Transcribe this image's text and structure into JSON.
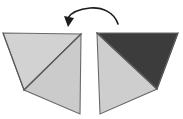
{
  "figure": {
    "canvas": {
      "width": 183,
      "height": 119,
      "background": "#ffffff"
    },
    "colors": {
      "light_gray": "#d2d2d2",
      "mid_gray": "#c9c9c9",
      "dark_gray": "#3c3c3c",
      "outline": "#6a6a6a",
      "fold_line": "#5a5a5a",
      "arrow": "#1d1d1d",
      "background": "#ffffff"
    },
    "left_shape": {
      "label": "left-folded-paper",
      "vertices": {
        "top_left": [
          3,
          33
        ],
        "top_right": [
          81,
          34
        ],
        "fold_vertex": [
          24,
          90
        ],
        "bottom_right": [
          80,
          114
        ]
      },
      "facets": [
        {
          "name": "upper-left-facet",
          "fill": "#d2d2d2",
          "points": "3,33 81,34 24,90"
        },
        {
          "name": "lower-right-facet",
          "fill": "#cbcbcb",
          "points": "24,90 81,34 80,114"
        }
      ],
      "fold_lines": [
        {
          "name": "main-diagonal-fold",
          "d": "M 24,90 L 81,34"
        },
        {
          "name": "left-edge-fold",
          "d": "M 3,33 L 24,90"
        }
      ]
    },
    "right_shape": {
      "label": "right-folded-paper",
      "vertices": {
        "top_left": [
          97,
          33
        ],
        "top_right": [
          178,
          33
        ],
        "fold_vertex": [
          157,
          89
        ],
        "bottom_left": [
          100,
          114
        ]
      },
      "facets": [
        {
          "name": "dark-upper-facet",
          "fill": "#3c3c3c",
          "points": "97,33 178,33 157,89"
        },
        {
          "name": "light-left-facet",
          "fill": "#cecece",
          "points": "97,33 157,89 100,114"
        }
      ],
      "fold_lines": [
        {
          "name": "main-diagonal-fold",
          "d": "M 97,33 L 157,89"
        },
        {
          "name": "right-edge-fold",
          "d": "M 178,33 L 157,89"
        }
      ]
    },
    "rotation_arrow": {
      "label": "flip-rotation-arrow",
      "direction": "right-to-left (counter-clockwise flip)",
      "arc_path": "M 118,24 C 114,12 102,7 90,8 C 79,9 71,13 68,18",
      "arrow_head_points": "68,27 64,16 74,18",
      "stroke_width": 1.6
    }
  }
}
